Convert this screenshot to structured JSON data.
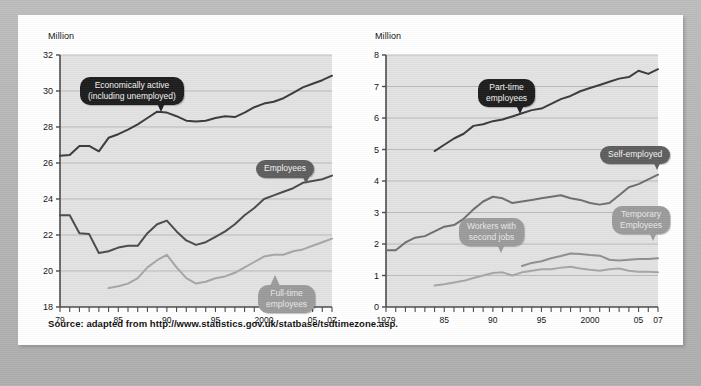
{
  "source_note": "Source: adapted from http://www.statistics.gov.uk/statbase/tsdtimezone.asp.",
  "colors": {
    "plot_background": "#e2e2e2",
    "grid": "#b0b0b0",
    "axis": "#4a4a4a",
    "series_dark": "#3a3a3a",
    "series_mid": "#6e6e6e",
    "series_light": "#a6a6a6",
    "callout_dark": "#1d1d1d",
    "callout_mid": "#5e5e5e",
    "callout_light": "#9b9b9b",
    "card": "#ffffff",
    "page": "#b9b9b9"
  },
  "left_chart": {
    "unit_label": "Million",
    "callouts": [
      {
        "id": "economically-active",
        "text": "Economically active\n(including unemployed)",
        "tone": "dark"
      },
      {
        "id": "employees",
        "text": "Employees",
        "tone": "mid"
      },
      {
        "id": "full-time-employees",
        "text": "Full-time\nemployees",
        "tone": "light"
      }
    ]
  },
  "right_chart": {
    "unit_label": "Million",
    "callouts": [
      {
        "id": "part-time-employees",
        "text": "Part-time\nemployees",
        "tone": "dark"
      },
      {
        "id": "self-employed",
        "text": "Self-employed",
        "tone": "mid"
      },
      {
        "id": "workers-with-second-jobs",
        "text": "Workers with\nsecond jobs",
        "tone": "light"
      },
      {
        "id": "temporary-employees",
        "text": "Temporary\nEmployees",
        "tone": "light"
      }
    ]
  },
  "chart_data": [
    {
      "type": "line",
      "id": "left",
      "title": "",
      "xlabel": "",
      "ylabel": "Million",
      "xlim": [
        1979,
        2007
      ],
      "ylim": [
        18,
        32
      ],
      "yticks": [
        18,
        20,
        22,
        24,
        26,
        28,
        30,
        32
      ],
      "xticks": [
        1979,
        1980,
        1981,
        1982,
        1983,
        1984,
        1985,
        1986,
        1987,
        1988,
        1989,
        1990,
        1991,
        1992,
        1993,
        1994,
        1995,
        1996,
        1997,
        1998,
        1999,
        2000,
        2001,
        2002,
        2003,
        2004,
        2005,
        2006,
        2007
      ],
      "xticklabels": {
        "1979": "79",
        "1985": "85",
        "1990": "90",
        "1995": "95",
        "2000": "2000",
        "2005": "05",
        "2007": "07"
      },
      "grid": true,
      "legend": "callouts-on-plot",
      "series": [
        {
          "name": "Economically active (including unemployed)",
          "color": "#3a3a3a",
          "x": [
            1979,
            1980,
            1981,
            1982,
            1983,
            1984,
            1985,
            1986,
            1987,
            1988,
            1989,
            1990,
            1991,
            1992,
            1993,
            1994,
            1995,
            1996,
            1997,
            1998,
            1999,
            2000,
            2001,
            2002,
            2003,
            2004,
            2005,
            2006,
            2007
          ],
          "values": [
            26.4,
            26.45,
            26.95,
            26.95,
            26.65,
            27.4,
            27.6,
            27.85,
            28.15,
            28.5,
            28.85,
            28.8,
            28.6,
            28.35,
            28.3,
            28.35,
            28.5,
            28.6,
            28.55,
            28.8,
            29.1,
            29.3,
            29.4,
            29.6,
            29.9,
            30.2,
            30.4,
            30.6,
            30.85
          ]
        },
        {
          "name": "Employees",
          "color": "#4a4a4a",
          "x": [
            1979,
            1980,
            1981,
            1982,
            1983,
            1984,
            1985,
            1986,
            1987,
            1988,
            1989,
            1990,
            1991,
            1992,
            1993,
            1994,
            1995,
            1996,
            1997,
            1998,
            1999,
            2000,
            2001,
            2002,
            2003,
            2004,
            2005,
            2006,
            2007
          ],
          "values": [
            23.1,
            23.1,
            22.1,
            22.05,
            21.0,
            21.1,
            21.3,
            21.4,
            21.4,
            22.1,
            22.6,
            22.8,
            22.2,
            21.7,
            21.45,
            21.6,
            21.9,
            22.2,
            22.6,
            23.1,
            23.5,
            24.0,
            24.2,
            24.4,
            24.6,
            24.9,
            25.0,
            25.1,
            25.3
          ]
        },
        {
          "name": "Full-time employees",
          "color": "#a6a6a6",
          "x": [
            1984,
            1985,
            1986,
            1987,
            1988,
            1989,
            1990,
            1991,
            1992,
            1993,
            1994,
            1995,
            1996,
            1997,
            1998,
            1999,
            2000,
            2001,
            2002,
            2003,
            2004,
            2005,
            2006,
            2007
          ],
          "values": [
            19.05,
            19.15,
            19.3,
            19.6,
            20.2,
            20.6,
            20.9,
            20.2,
            19.6,
            19.3,
            19.4,
            19.6,
            19.7,
            19.9,
            20.2,
            20.5,
            20.8,
            20.9,
            20.9,
            21.1,
            21.2,
            21.4,
            21.6,
            21.8
          ]
        }
      ]
    },
    {
      "type": "line",
      "id": "right",
      "title": "",
      "xlabel": "",
      "ylabel": "Million",
      "xlim": [
        1979,
        2007
      ],
      "ylim": [
        0,
        8
      ],
      "yticks": [
        0,
        1,
        2,
        3,
        4,
        5,
        6,
        7,
        8
      ],
      "xticks": [
        1979,
        1980,
        1981,
        1982,
        1983,
        1984,
        1985,
        1986,
        1987,
        1988,
        1989,
        1990,
        1991,
        1992,
        1993,
        1994,
        1995,
        1996,
        1997,
        1998,
        1999,
        2000,
        2001,
        2002,
        2003,
        2004,
        2005,
        2006,
        2007
      ],
      "xticklabels": {
        "1979": "1979",
        "1985": "85",
        "1990": "90",
        "1995": "95",
        "2000": "2000",
        "2005": "05",
        "2007": "07"
      },
      "grid": true,
      "legend": "callouts-on-plot",
      "series": [
        {
          "name": "Part-time employees",
          "color": "#3a3a3a",
          "x": [
            1984,
            1985,
            1986,
            1987,
            1988,
            1989,
            1990,
            1991,
            1992,
            1993,
            1994,
            1995,
            1996,
            1997,
            1998,
            1999,
            2000,
            2001,
            2002,
            2003,
            2004,
            2005,
            2006,
            2007
          ],
          "values": [
            4.95,
            5.15,
            5.35,
            5.5,
            5.75,
            5.8,
            5.9,
            5.95,
            6.05,
            6.15,
            6.25,
            6.3,
            6.45,
            6.6,
            6.7,
            6.85,
            6.95,
            7.05,
            7.15,
            7.25,
            7.3,
            7.5,
            7.4,
            7.55
          ]
        },
        {
          "name": "Self-employed",
          "color": "#6e6e6e",
          "x": [
            1979,
            1980,
            1981,
            1982,
            1983,
            1984,
            1985,
            1986,
            1987,
            1988,
            1989,
            1990,
            1991,
            1992,
            1993,
            1994,
            1995,
            1996,
            1997,
            1998,
            1999,
            2000,
            2001,
            2002,
            2003,
            2004,
            2005,
            2006,
            2007
          ],
          "values": [
            1.8,
            1.8,
            2.05,
            2.2,
            2.25,
            2.4,
            2.55,
            2.6,
            2.8,
            3.1,
            3.35,
            3.5,
            3.45,
            3.3,
            3.35,
            3.4,
            3.45,
            3.5,
            3.55,
            3.45,
            3.4,
            3.3,
            3.25,
            3.3,
            3.55,
            3.8,
            3.9,
            4.05,
            4.2
          ]
        },
        {
          "name": "Workers with second jobs",
          "color": "#a6a6a6",
          "x": [
            1984,
            1985,
            1986,
            1987,
            1988,
            1989,
            1990,
            1991,
            1992,
            1993,
            1994,
            1995,
            1996,
            1997,
            1998,
            1999,
            2000,
            2001,
            2002,
            2003,
            2004,
            2005,
            2006,
            2007
          ],
          "values": [
            0.68,
            0.72,
            0.78,
            0.83,
            0.92,
            1.0,
            1.08,
            1.1,
            1.0,
            1.1,
            1.15,
            1.2,
            1.2,
            1.25,
            1.28,
            1.22,
            1.18,
            1.15,
            1.2,
            1.22,
            1.15,
            1.12,
            1.12,
            1.1
          ]
        },
        {
          "name": "Temporary Employees",
          "color": "#8f8f8f",
          "x": [
            1993,
            1994,
            1995,
            1996,
            1997,
            1998,
            1999,
            2000,
            2001,
            2002,
            2003,
            2004,
            2005,
            2006,
            2007
          ],
          "values": [
            1.3,
            1.4,
            1.45,
            1.55,
            1.62,
            1.7,
            1.68,
            1.65,
            1.63,
            1.5,
            1.48,
            1.5,
            1.52,
            1.52,
            1.55
          ]
        }
      ]
    }
  ]
}
